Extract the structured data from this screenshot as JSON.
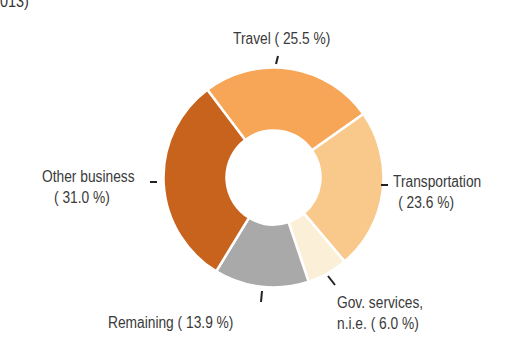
{
  "title_fragment": ".013)",
  "chart_data": {
    "type": "pie",
    "variant": "donut",
    "title": "",
    "start_angle_deg": -37,
    "direction": "clockwise",
    "categories": [
      "Travel",
      "Transportation",
      "Gov. services, n.i.e.",
      "Remaining",
      "Other business"
    ],
    "values": [
      25.5,
      23.6,
      6.0,
      13.9,
      31.0
    ],
    "unit": "%",
    "colors": [
      "#f6a656",
      "#f9c98c",
      "#fbefd8",
      "#a9a9a9",
      "#c8631e"
    ],
    "labels": [
      {
        "line1": "Travel ( 25.5 %)",
        "line2": ""
      },
      {
        "line1": "Transportation",
        "line2": "( 23.6 %)"
      },
      {
        "line1": "Gov. services,",
        "line2": "n.i.e. (  6.0 %)"
      },
      {
        "line1": "Remaining ( 13.9 %)",
        "line2": ""
      },
      {
        "line1": "Other business",
        "line2": "( 31.0 %)"
      }
    ],
    "legend": "none (direct labels)"
  }
}
